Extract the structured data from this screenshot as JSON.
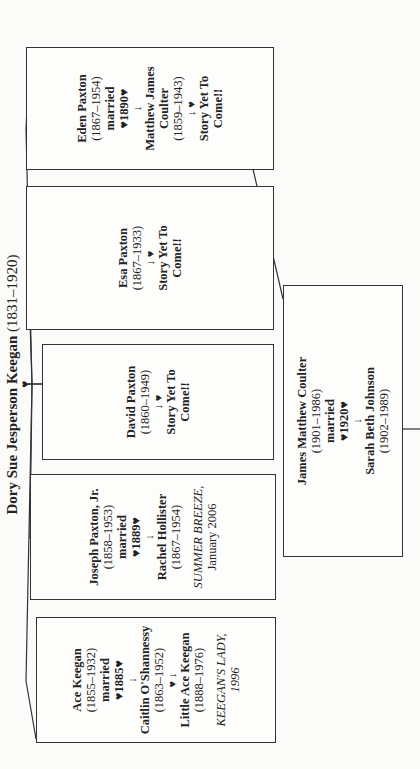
{
  "root": {
    "name": "Dory Sue Jesperson Keegan",
    "dates": "(1831–1920)"
  },
  "children": [
    {
      "name": "Ace Keegan",
      "dates": "(1855–1932)",
      "married": "married",
      "marriage_year": "♥1885♥",
      "arrow": "↓",
      "spouse": "Caitlin O'Shannessy",
      "spouse_dates": "(1863–1952)",
      "child_arrow": "♥ ↓",
      "child": "Little Ace Keegan",
      "child_dates": "(1888–1976)",
      "book_title": "KEEGAN'S LADY,",
      "book_date": "1996"
    },
    {
      "name": "Joseph Paxton, Jr.",
      "dates": "(1858–1953)",
      "married": "married",
      "marriage_year": "♥1889♥",
      "arrow": "↓",
      "spouse": "Rachel Hollister",
      "spouse_dates": "(1867–1954)",
      "book_title": "SUMMER BREEZE,",
      "book_date": "January 2006"
    },
    {
      "name": "David Paxton",
      "dates": "(1860–1949)",
      "arrow": "↓ ♥",
      "story": "Story Yet To Come!!"
    },
    {
      "name": "Esa Paxton",
      "dates": "(1867–1933)",
      "arrow": "↓ ♥",
      "story": "Story Yet To Come!!"
    },
    {
      "name": "Eden Paxton",
      "dates": "(1867–1954)",
      "married": "married",
      "marriage_year": "♥1890♥",
      "arrow": "↓",
      "spouse": "Matthew James Coulter",
      "spouse_dates": "(1859–1943)",
      "child_arrow": "↓ ♥",
      "story": "Story Yet To Come!!"
    }
  ],
  "grandchild": {
    "name": "James Matthew Coulter",
    "dates": "(1901–1986)",
    "married": "married",
    "marriage_year": "♥1920♥",
    "arrow": "↓",
    "spouse": "Sarah Beth Johnson",
    "spouse_dates": "(1902–1989)"
  }
}
